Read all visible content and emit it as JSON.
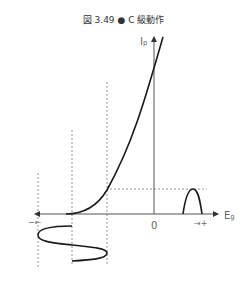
{
  "figure": {
    "title": "図 3.49 ● C 級動作"
  },
  "axes": {
    "y_label": "I",
    "y_label_sub": "p",
    "x_label": "E",
    "x_label_sub": "g",
    "origin_label": "0",
    "neg_label": "−←",
    "pos_label": "→+"
  },
  "colors": {
    "curve": "#1a1a1a",
    "axis": "#555555",
    "dashed": "#777777"
  }
}
